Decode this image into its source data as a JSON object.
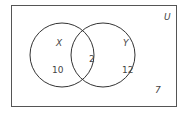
{
  "diagram": {
    "type": "venn",
    "universe_label": "U",
    "sets": [
      {
        "label": "X",
        "only_count": "10"
      },
      {
        "label": "Y",
        "only_count": "12"
      }
    ],
    "intersection_count": "2",
    "outside_count": "7",
    "colors": {
      "stroke": "#333333",
      "background": "#ffffff"
    }
  }
}
